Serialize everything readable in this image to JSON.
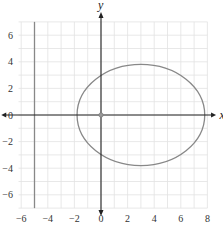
{
  "chart_data": {
    "type": "line",
    "title": "",
    "xlabel": "x",
    "ylabel": "y",
    "xlim": [
      -7,
      8
    ],
    "ylim": [
      -7,
      7
    ],
    "grid": true,
    "x_ticks": [
      "-6",
      "-4",
      "-2",
      "0",
      "2",
      "4",
      "6",
      "8"
    ],
    "y_ticks": [
      "6",
      "4",
      "2",
      "0",
      "-2",
      "-4",
      "-6"
    ],
    "series": [
      {
        "name": "ellipse",
        "shape": "ellipse",
        "center": [
          3,
          0
        ],
        "semi_axis_x": 4.8,
        "semi_axis_y": 3.8,
        "color": "#888888"
      },
      {
        "name": "vertical line x = -5",
        "shape": "vline",
        "x": -5,
        "color": "#888888"
      }
    ],
    "points": [
      {
        "x": 0,
        "y": 0,
        "label": "origin"
      }
    ]
  },
  "colors": {
    "grid": "#e2e2e2",
    "axis": "#222222",
    "curve": "#8a8a8a"
  }
}
